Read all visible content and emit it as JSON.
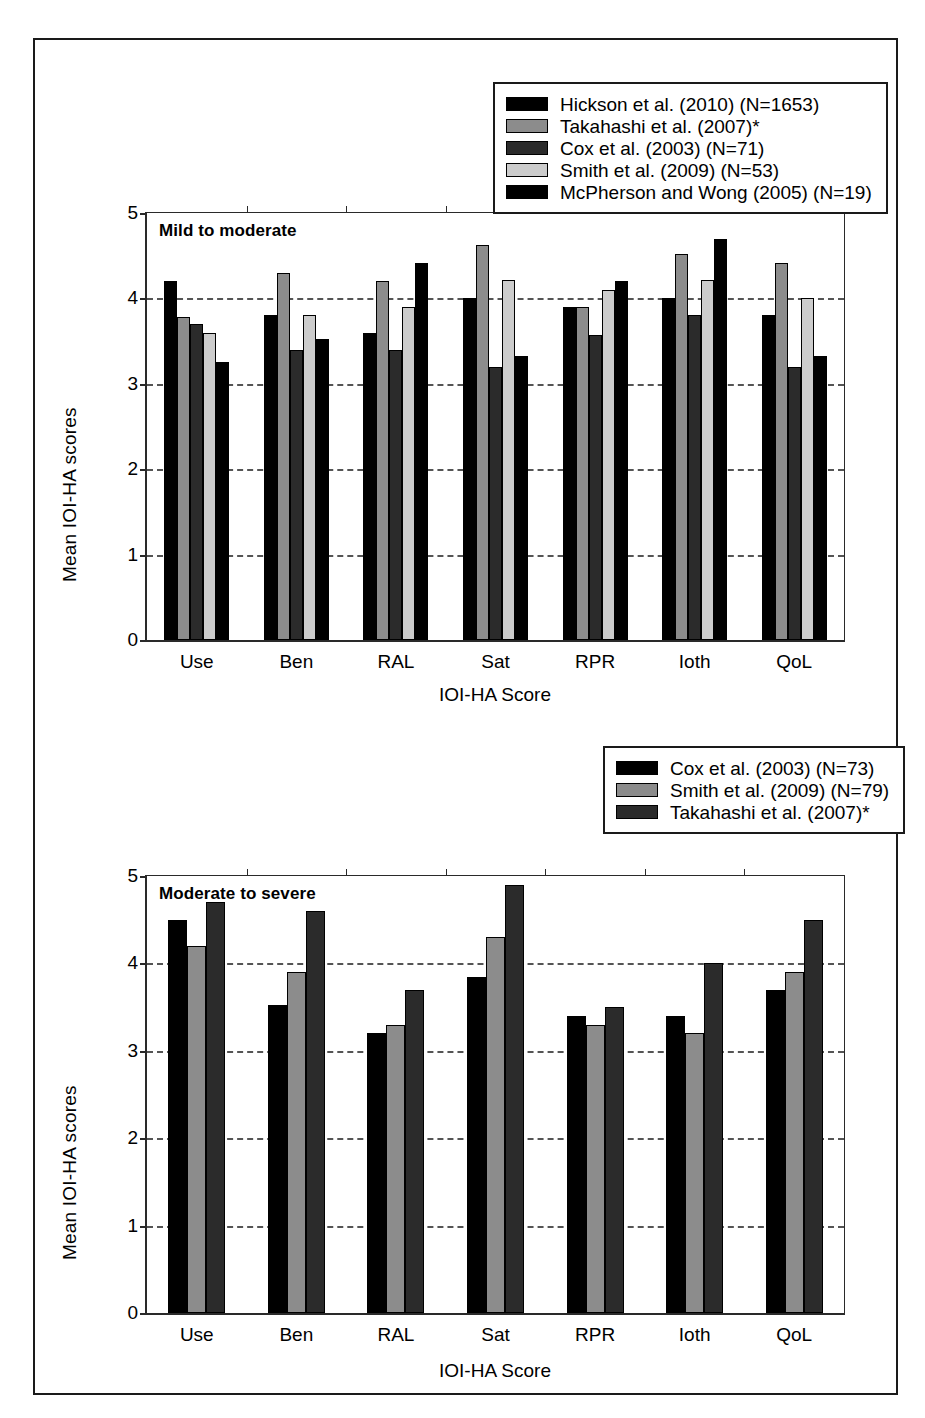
{
  "figure": {
    "panels": [
      {
        "tag": "Mild to moderate"
      },
      {
        "tag": "Moderate to severe"
      }
    ]
  },
  "colors": {
    "black": "#000000",
    "medium_gray": "#8c8c8c",
    "dark_gray": "#2b2b2b",
    "light_gray": "#cccccc",
    "axis": "#2a2a2a",
    "grid": "#555555",
    "frame": "#1a1a1a"
  },
  "chart_data": [
    {
      "type": "bar",
      "title": "Mild to moderate",
      "xlabel": "IOI-HA Score",
      "ylabel": "Mean IOI-HA scores",
      "ylim": [
        0,
        5
      ],
      "yticks": [
        0,
        1,
        2,
        3,
        4,
        5
      ],
      "grid": true,
      "legend_position": "top-right",
      "categories": [
        "Use",
        "Ben",
        "RAL",
        "Sat",
        "RPR",
        "Ioth",
        "QoL"
      ],
      "series": [
        {
          "name": "Hickson et al. (2010) (N=1653)",
          "color": "#000000",
          "values": [
            4.2,
            3.8,
            3.6,
            4.0,
            3.9,
            4.0,
            3.8
          ]
        },
        {
          "name": "Takahashi et al. (2007)*",
          "color": "#8c8c8c",
          "values": [
            3.78,
            4.3,
            4.2,
            4.62,
            3.9,
            4.52,
            4.42
          ]
        },
        {
          "name": "Cox et al. (2003) (N=71)",
          "color": "#2b2b2b",
          "values": [
            3.7,
            3.4,
            3.4,
            3.2,
            3.57,
            3.8,
            3.2
          ]
        },
        {
          "name": "Smith et al. (2009) (N=53)",
          "color": "#cccccc",
          "values": [
            3.6,
            3.8,
            3.9,
            4.22,
            4.1,
            4.22,
            4.0
          ]
        },
        {
          "name": "McPherson and Wong (2005) (N=19)",
          "color": "#000000",
          "values": [
            3.25,
            3.52,
            4.42,
            3.33,
            4.2,
            4.7,
            3.33
          ]
        }
      ]
    },
    {
      "type": "bar",
      "title": "Moderate to severe",
      "xlabel": "IOI-HA Score",
      "ylabel": "Mean IOI-HA scores",
      "ylim": [
        0,
        5
      ],
      "yticks": [
        0,
        1,
        2,
        3,
        4,
        5
      ],
      "grid": true,
      "legend_position": "top-right",
      "categories": [
        "Use",
        "Ben",
        "RAL",
        "Sat",
        "RPR",
        "Ioth",
        "QoL"
      ],
      "series": [
        {
          "name": "Cox et al. (2003) (N=73)",
          "color": "#000000",
          "values": [
            4.5,
            3.52,
            3.2,
            3.85,
            3.4,
            3.4,
            3.7
          ]
        },
        {
          "name": "Smith et al. (2009) (N=79)",
          "color": "#8c8c8c",
          "values": [
            4.2,
            3.9,
            3.3,
            4.3,
            3.3,
            3.2,
            3.9
          ]
        },
        {
          "name": "Takahashi et al. (2007)*",
          "color": "#2b2b2b",
          "values": [
            4.7,
            4.6,
            3.7,
            4.9,
            3.5,
            4.0,
            4.5
          ]
        }
      ]
    }
  ]
}
